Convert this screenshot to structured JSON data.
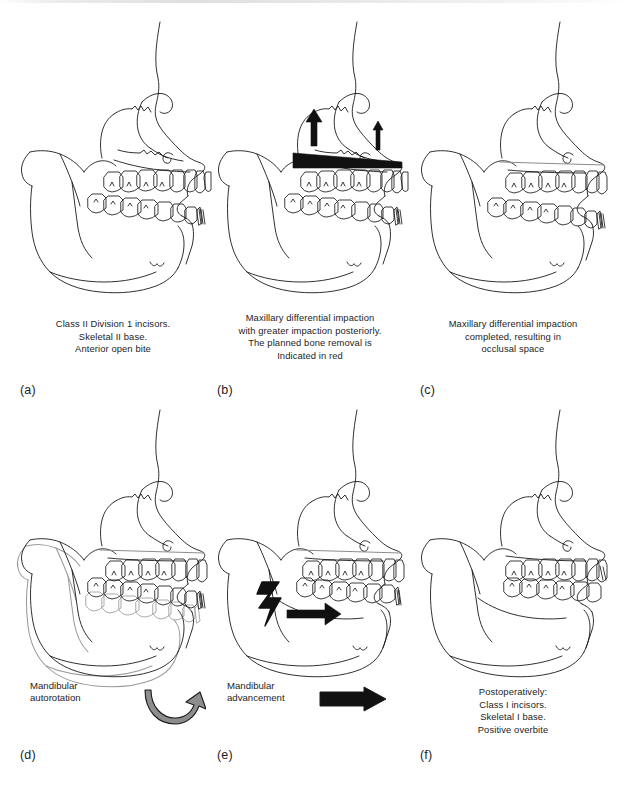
{
  "figure": {
    "type": "lateral-cephalometric-tracing-series",
    "background_color": "#ffffff",
    "line_color": "#1a1a1a",
    "overlay_gray": "#8a8a8a",
    "highlight_black": "#111111"
  },
  "panels": [
    {
      "letter": "(a)",
      "caption_lines": [
        "Class II Division 1 incisors.",
        "Skeletal II base.",
        "Anterior open bite"
      ],
      "annotation": null
    },
    {
      "letter": "(b)",
      "caption_lines": [
        "Maxillary differential impaction",
        "with greater impaction posteriorly.",
        "The planned bone removal is",
        "Indicated in red"
      ],
      "annotation": null
    },
    {
      "letter": "(c)",
      "caption_lines": [
        "Maxillary differential impaction",
        "completed, resulting in",
        "occlusal space"
      ],
      "annotation": null
    },
    {
      "letter": "(d)",
      "caption_lines": [],
      "annotation": {
        "lines": [
          "Mandibular",
          "autorotation"
        ],
        "icon": "curved-rotation-arrow-icon"
      }
    },
    {
      "letter": "(e)",
      "caption_lines": [],
      "annotation": {
        "lines": [
          "Mandibular",
          "advancement"
        ],
        "icon": "straight-right-arrow-icon"
      }
    },
    {
      "letter": "(f)",
      "caption_lines": [
        "Postoperatively:",
        "Class I incisors.",
        "Skeletal I base.",
        "Positive overbite"
      ],
      "annotation": null
    }
  ],
  "footer": {
    "cut_off_text": ""
  }
}
